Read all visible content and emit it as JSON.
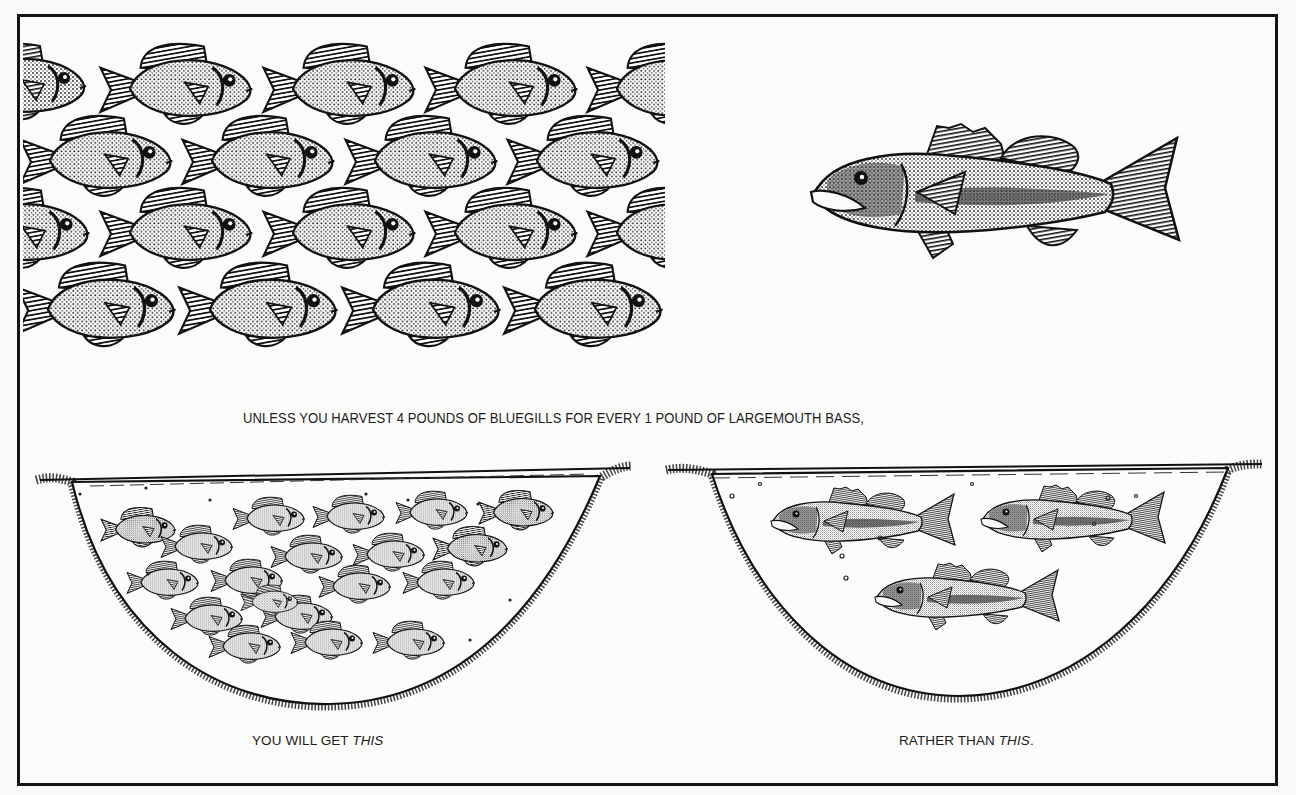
{
  "illustration": {
    "title": "Bluegill to largemouth bass harvest ratio",
    "panels": {
      "top_left": {
        "subject": "bluegill",
        "description": "tessellated school of bluegills"
      },
      "top_right": {
        "subject": "largemouth bass",
        "description": "single largemouth bass"
      },
      "bottom_left": {
        "subject": "pond",
        "description": "pond overcrowded with stunted bluegills",
        "fish_count": 19
      },
      "bottom_right": {
        "subject": "pond",
        "description": "pond with three largemouth bass",
        "fish_count": 3
      }
    },
    "colors": {
      "ink": "#141414",
      "paper": "#fbfbf9"
    }
  },
  "captions": {
    "main": "UNLESS YOU HARVEST 4 POUNDS OF  BLUEGILLS FOR EVERY 1 POUND OF  LARGEMOUTH BASS,",
    "left_prefix": "YOU WILL GET ",
    "left_emphasis": "THIS",
    "right_prefix": "RATHER THAN ",
    "right_emphasis": "THIS",
    "right_suffix": "."
  }
}
